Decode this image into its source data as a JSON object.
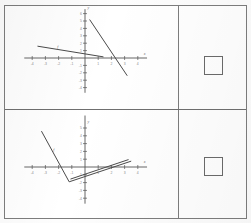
{
  "document": {
    "type": "worksheet-grid",
    "rows": 2,
    "columns": 2,
    "frame_color": "#7d7d7d",
    "background": "#ffffff"
  },
  "answers": {
    "top": {
      "name": "answer-box",
      "value": "",
      "shape": "square",
      "border_color": "#6b6b6b"
    },
    "bottom": {
      "name": "answer-box",
      "value": "",
      "shape": "square",
      "border_color": "#6b6b6b"
    }
  },
  "chart_data": [
    {
      "type": "line",
      "title": "",
      "xlabel": "x",
      "ylabel": "y",
      "xlim": [
        -5,
        5
      ],
      "ylim": [
        -5,
        7
      ],
      "grid": false,
      "legend": "none",
      "axis_color": "#555555",
      "line_color": "#4a4a4a",
      "xticks": [
        -4,
        -3,
        -2,
        -1,
        1,
        2,
        3,
        4
      ],
      "yticks": [
        -4,
        -3,
        -2,
        -1,
        1,
        2,
        3,
        4,
        5,
        6
      ],
      "xtick_labels": [
        "-4",
        "-3",
        "-2",
        "-1",
        "1",
        "2",
        "3",
        "4"
      ],
      "ytick_labels": [
        "-4",
        "-3",
        "-2",
        "-1",
        "1",
        "2",
        "3",
        "4",
        "5",
        "6"
      ],
      "series": [
        {
          "name": "shallow-negative-line",
          "label": "f",
          "points": [
            [
              -3.6,
              1.6
            ],
            [
              1.4,
              0.15
            ]
          ]
        },
        {
          "name": "steep-negative-line",
          "label": "",
          "points": [
            [
              0.35,
              5.2
            ],
            [
              3.2,
              -2.4
            ]
          ]
        }
      ],
      "annotations": [
        {
          "text": "f",
          "x": -2.1,
          "y": 1.35
        },
        {
          "text": "y",
          "x": 0.18,
          "y": 6.6
        },
        {
          "text": "x",
          "x": 4.45,
          "y": 0.45
        }
      ]
    },
    {
      "type": "line",
      "title": "",
      "xlabel": "x",
      "ylabel": "y",
      "xlim": [
        -5,
        5
      ],
      "ylim": [
        -5,
        7
      ],
      "grid": false,
      "legend": "none",
      "axis_color": "#555555",
      "line_color": "#4a4a4a",
      "xticks": [
        -4,
        -3,
        -2,
        -1,
        1,
        2,
        3,
        4
      ],
      "yticks": [
        -4,
        -3,
        -2,
        -1,
        1,
        2,
        3,
        4,
        5
      ],
      "xtick_labels": [
        "-4",
        "-3",
        "-2",
        "-1",
        "1",
        "2",
        "3",
        "4"
      ],
      "ytick_labels": [
        "-4",
        "-3",
        "-2",
        "-1",
        "1",
        "2",
        "3",
        "4",
        "5"
      ],
      "series": [
        {
          "name": "v-shaped-piecewise",
          "label": "f",
          "points": [
            [
              -3.3,
              4.6
            ],
            [
              -1.2,
              -1.9
            ],
            [
              3.5,
              0.75
            ]
          ]
        },
        {
          "name": "shallow-rising-line",
          "label": "",
          "points": [
            [
              -1.1,
              -1.55
            ],
            [
              3.3,
              0.95
            ]
          ]
        }
      ],
      "annotations": [
        {
          "text": "f",
          "x": -2.4,
          "y": 2.0
        },
        {
          "text": "y",
          "x": 0.18,
          "y": 5.7
        },
        {
          "text": "x",
          "x": 4.45,
          "y": 0.45
        }
      ]
    }
  ]
}
